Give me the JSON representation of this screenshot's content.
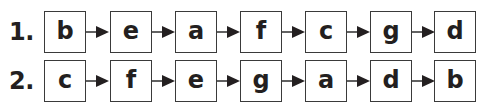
{
  "sequences": [
    {
      "label": "1.",
      "items": [
        "b",
        "e",
        "a",
        "f",
        "c",
        "g",
        "d"
      ]
    },
    {
      "label": "2.",
      "items": [
        "c",
        "f",
        "e",
        "g",
        "a",
        "d",
        "b"
      ]
    }
  ],
  "icons": {
    "connector": "right-arrow-icon"
  },
  "colors": {
    "line": "#3a3a3a",
    "text": "#231f20",
    "background": "#ffffff"
  }
}
